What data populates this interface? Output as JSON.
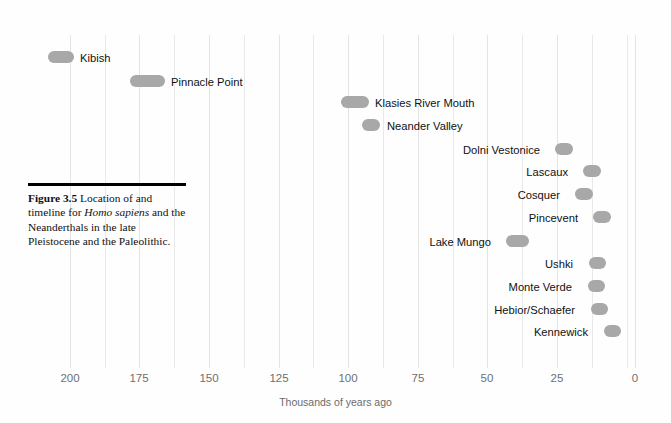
{
  "chart_data": {
    "type": "bar",
    "orientation": "horizontal",
    "title": "Location of and timeline for Homo sapiens and the Neanderthals in the late Pleistocene and the Paleolithic.",
    "xlabel": "Thousands of years ago",
    "ylabel": "",
    "xlim": [
      210,
      0
    ],
    "x_axis_reversed": true,
    "tick_labels": [
      "200",
      "175",
      "150",
      "125",
      "100",
      "75",
      "50",
      "25",
      "0"
    ],
    "tick_values": [
      200,
      175,
      150,
      125,
      100,
      75,
      50,
      25,
      0
    ],
    "grid": true,
    "grid_interval": 12.5,
    "legend": "none",
    "bar_color": "#a8a8a8",
    "categories": [
      "Kibish",
      "Pinnacle Point",
      "Klasies River Mouth",
      "Neander Valley",
      "Dolni Vestonice",
      "Lascaux",
      "Cosquer",
      "Pincevent",
      "Lake Mungo",
      "Ushki",
      "Monte Verde",
      "Hebior/Schaefer",
      "Kennewick"
    ],
    "ranges": [
      {
        "name": "Kibish",
        "start": 208,
        "end": 198,
        "label_side": "right"
      },
      {
        "name": "Pinnacle Point",
        "start": 178,
        "end": 165,
        "label_side": "right"
      },
      {
        "name": "Klasies River Mouth",
        "start": 105,
        "end": 95,
        "label_side": "right"
      },
      {
        "name": "Neander Valley",
        "start": 97,
        "end": 91,
        "label_side": "right"
      },
      {
        "name": "Dolni Vestonice",
        "start": 29,
        "end": 23,
        "label_side": "left"
      },
      {
        "name": "Lascaux",
        "start": 19,
        "end": 13,
        "label_side": "left"
      },
      {
        "name": "Cosquer",
        "start": 22,
        "end": 16,
        "label_side": "left"
      },
      {
        "name": "Pincevent",
        "start": 16,
        "end": 10,
        "label_side": "left"
      },
      {
        "name": "Lake Mungo",
        "start": 46,
        "end": 38,
        "label_side": "left"
      },
      {
        "name": "Ushki",
        "start": 16,
        "end": 11,
        "label_side": "left"
      },
      {
        "name": "Monte Verde",
        "start": 16,
        "end": 11,
        "label_side": "left"
      },
      {
        "name": "Hebior/Schaefer",
        "start": 15,
        "end": 10,
        "label_side": "left"
      },
      {
        "name": "Kennewick",
        "start": 10,
        "end": 5,
        "label_side": "left"
      }
    ]
  },
  "caption": {
    "figure_number": "Figure 3.5",
    "line1": "Location of and",
    "line2_pre": "timeline for ",
    "line2_italic": "Homo sapiens",
    "line2_post": " and",
    "line3": "the Neanderthals in the late",
    "line4": "Pleistocene and the Paleolithic."
  },
  "axis": {
    "title": "Thousands of years ago",
    "ticks": [
      "200",
      "175",
      "150",
      "125",
      "100",
      "75",
      "50",
      "25",
      "0"
    ]
  },
  "rows": [
    {
      "label": "Kibish",
      "bar_left": 48,
      "bar_width": 26,
      "top": 51,
      "label_left": 80,
      "label_top": 52,
      "side": "right"
    },
    {
      "label": "Pinnacle Point",
      "bar_left": 130,
      "bar_width": 35,
      "top": 75,
      "label_left": 171,
      "label_top": 76,
      "side": "right"
    },
    {
      "label": "Klasies River Mouth",
      "bar_left": 341,
      "bar_width": 28,
      "top": 96,
      "label_left": 375,
      "label_top": 97,
      "side": "right"
    },
    {
      "label": "Neander Valley",
      "bar_left": 362,
      "bar_width": 18,
      "top": 119,
      "label_left": 387,
      "label_top": 120,
      "side": "right"
    },
    {
      "label": "Dolni Vestonice",
      "bar_left": 555,
      "bar_width": 18,
      "top": 143,
      "label_right": 131,
      "label_top": 144,
      "side": "left"
    },
    {
      "label": "Lascaux",
      "bar_left": 583,
      "bar_width": 18,
      "top": 165,
      "label_right": 103,
      "label_top": 166,
      "side": "left"
    },
    {
      "label": "Cosquer",
      "bar_left": 575,
      "bar_width": 18,
      "top": 188,
      "label_right": 111,
      "label_top": 189,
      "side": "left"
    },
    {
      "label": "Pincevent",
      "bar_left": 593,
      "bar_width": 18,
      "top": 211,
      "label_right": 93,
      "label_top": 212,
      "side": "left"
    },
    {
      "label": "Lake Mungo",
      "bar_left": 506,
      "bar_width": 23,
      "top": 235,
      "label_right": 180,
      "label_top": 236,
      "side": "left"
    },
    {
      "label": "Ushki",
      "bar_left": 589,
      "bar_width": 17,
      "top": 257,
      "label_right": 98,
      "label_top": 258,
      "side": "left"
    },
    {
      "label": "Monte Verde",
      "bar_left": 588,
      "bar_width": 17,
      "top": 280,
      "label_right": 99,
      "label_top": 281,
      "side": "left"
    },
    {
      "label": "Hebior/Schaefer",
      "bar_left": 591,
      "bar_width": 17,
      "top": 303,
      "label_right": 96,
      "label_top": 304,
      "side": "left"
    },
    {
      "label": "Kennewick",
      "bar_left": 604,
      "bar_width": 17,
      "top": 325,
      "label_right": 83,
      "label_top": 326,
      "side": "left"
    }
  ],
  "geometry": {
    "grid_x": [
      70,
      105,
      139,
      174,
      209,
      244,
      279,
      313,
      348,
      383,
      418,
      453,
      487,
      522,
      557,
      592,
      627,
      635
    ],
    "major_x": [
      70,
      139,
      209,
      279,
      348,
      418,
      487,
      557,
      635
    ],
    "tick_label_x": [
      50,
      119,
      189,
      259,
      328,
      398,
      467,
      537,
      615
    ]
  }
}
